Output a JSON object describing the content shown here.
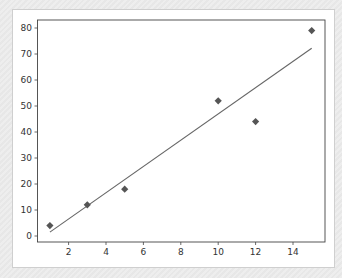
{
  "chart_data": {
    "type": "scatter",
    "title": "",
    "xlabel": "",
    "ylabel": "",
    "xlim": [
      0.3,
      15.7
    ],
    "ylim": [
      -2.3,
      82.3
    ],
    "grid": false,
    "legend": null,
    "x_ticks": [
      2,
      4,
      6,
      8,
      10,
      12,
      14
    ],
    "y_ticks": [
      0,
      10,
      20,
      30,
      40,
      50,
      60,
      70,
      80
    ],
    "series": [
      {
        "name": "data points",
        "kind": "scatter",
        "marker": "diamond",
        "color": "#555555",
        "x": [
          1,
          3,
          5,
          10,
          12,
          15
        ],
        "y": [
          4,
          12,
          18,
          52,
          44,
          79
        ]
      },
      {
        "name": "linear fit",
        "kind": "line",
        "color": "#666666",
        "x": [
          1,
          15
        ],
        "y": [
          1.5,
          72.2
        ]
      }
    ]
  },
  "colors": {
    "marker": "#555555",
    "line": "#666666",
    "axes": "#444444",
    "background": "#ffffff"
  }
}
